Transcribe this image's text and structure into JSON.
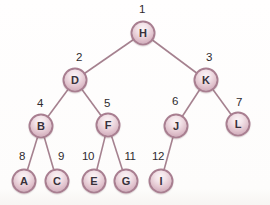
{
  "diagram": {
    "type": "binary-tree",
    "colors": {
      "background": "#ffffff",
      "node_border": "#a87e90",
      "node_fill_center": "#fbf4f6",
      "node_fill_edge": "#c8a0b1",
      "edge_line": "#a5818f",
      "letter_text": "#38313a",
      "order_text": "#2e2a2e"
    },
    "nodes": [
      {
        "id": "H",
        "letter": "H",
        "order": "1",
        "x": 143,
        "y": 33,
        "lx": 142,
        "ly": 10
      },
      {
        "id": "D",
        "letter": "D",
        "order": "2",
        "x": 75,
        "y": 80,
        "lx": 79,
        "ly": 58
      },
      {
        "id": "K",
        "letter": "K",
        "order": "3",
        "x": 206,
        "y": 80,
        "lx": 209,
        "ly": 58
      },
      {
        "id": "B",
        "letter": "B",
        "order": "4",
        "x": 41,
        "y": 126,
        "lx": 40,
        "ly": 104
      },
      {
        "id": "F",
        "letter": "F",
        "order": "5",
        "x": 108,
        "y": 125,
        "lx": 107,
        "ly": 104
      },
      {
        "id": "J",
        "letter": "J",
        "order": "6",
        "x": 176,
        "y": 126,
        "lx": 175,
        "ly": 102
      },
      {
        "id": "L",
        "letter": "L",
        "order": "7",
        "x": 238,
        "y": 124,
        "lx": 239,
        "ly": 103
      },
      {
        "id": "A",
        "letter": "A",
        "order": "8",
        "x": 24,
        "y": 181,
        "lx": 22,
        "ly": 157
      },
      {
        "id": "C",
        "letter": "C",
        "order": "9",
        "x": 57,
        "y": 181,
        "lx": 61,
        "ly": 157
      },
      {
        "id": "E",
        "letter": "E",
        "order": "10",
        "x": 94,
        "y": 181,
        "lx": 88,
        "ly": 157
      },
      {
        "id": "G",
        "letter": "G",
        "order": "11",
        "x": 126,
        "y": 181,
        "lx": 130,
        "ly": 157
      },
      {
        "id": "I",
        "letter": "I",
        "order": "12",
        "x": 161,
        "y": 181,
        "lx": 158,
        "ly": 157
      }
    ],
    "edges": [
      [
        "H",
        "D"
      ],
      [
        "H",
        "K"
      ],
      [
        "D",
        "B"
      ],
      [
        "D",
        "F"
      ],
      [
        "K",
        "J"
      ],
      [
        "K",
        "L"
      ],
      [
        "B",
        "A"
      ],
      [
        "B",
        "C"
      ],
      [
        "F",
        "E"
      ],
      [
        "F",
        "G"
      ],
      [
        "J",
        "I"
      ]
    ]
  }
}
